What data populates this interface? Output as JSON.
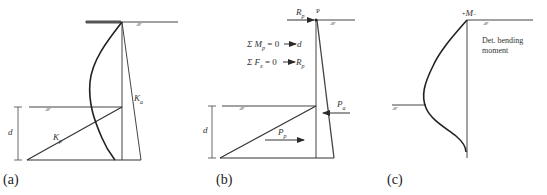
{
  "panels": [
    {
      "id": "a",
      "caption": "(a)",
      "labels": {
        "active": "K",
        "active_sub": "a",
        "passive": "K",
        "passive_sub": "p",
        "depth": "d"
      }
    },
    {
      "id": "b",
      "caption": "(b)",
      "labels": {
        "reaction": "R",
        "reaction_sub": "p",
        "point": "P",
        "eq1": "Σ M",
        "eq1_sub": "p",
        "eq1_rhs": " = 0 ─► d",
        "eq2": "Σ F",
        "eq2_sub": "x",
        "eq2_rhs": " = 0 ─► R",
        "eq2_rhs_sub": "p",
        "active_force": "P",
        "active_force_sub": "a",
        "passive_force": "P",
        "passive_force_sub": "p",
        "depth": "d"
      }
    },
    {
      "id": "c",
      "caption": "(c)",
      "labels": {
        "moment_symbol": "M",
        "moment_prefix": "+",
        "moment_suffix": "−",
        "description_line1": "Det. bending",
        "description_line2": "moment"
      }
    }
  ],
  "ground_hatch": "⁄⁄⁄⁄⁄⁄⁄⁄⁄⁄",
  "colors": {
    "line": "#2a2a2a",
    "thin": "#555555",
    "text": "#333333"
  }
}
